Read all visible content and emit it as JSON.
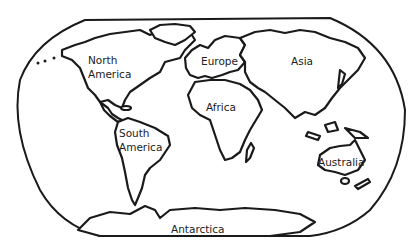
{
  "map": {
    "type": "world-continents-outline",
    "colors": {
      "outline": "#1a1a1a",
      "fill": "#ffffff",
      "text": "#222222"
    },
    "continents": [
      {
        "id": "north-america",
        "label_line1": "North",
        "label_line2": "America"
      },
      {
        "id": "south-america",
        "label_line1": "South",
        "label_line2": "America"
      },
      {
        "id": "europe",
        "label": "Europe"
      },
      {
        "id": "africa",
        "label": "Africa"
      },
      {
        "id": "asia",
        "label": "Asia"
      },
      {
        "id": "australia",
        "label": "Australia"
      },
      {
        "id": "antarctica",
        "label": "Antarctica"
      }
    ]
  }
}
